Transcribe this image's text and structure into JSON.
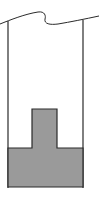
{
  "diagram": {
    "colors": {
      "stroke": "#2a2a2a",
      "solid_fill": "#9a9a9a",
      "background": "#ffffff"
    }
  }
}
